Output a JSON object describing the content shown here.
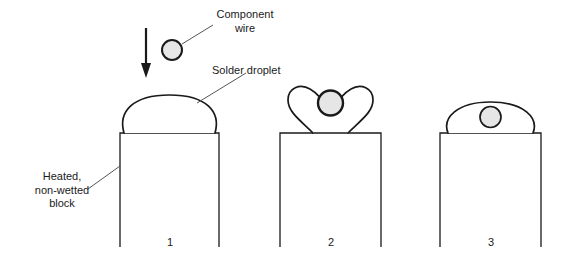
{
  "figure": {
    "title_present": false,
    "background_color": "#ffffff",
    "stroke_color": "#1a1a1a",
    "wire_fill_color": "#e6e6e6",
    "droplet_fill_color": "#ffffff"
  },
  "annotations": {
    "component_wire": {
      "lines": [
        "Component",
        "wire"
      ],
      "text": "Component wire"
    },
    "solder_droplet": {
      "lines": [
        "Solder droplet"
      ],
      "text": "Solder droplet"
    },
    "heated_block": {
      "lines": [
        "Heated,",
        "non-wetted",
        "block"
      ],
      "text": "Heated, non-wetted block"
    }
  },
  "panels": [
    {
      "number": "1",
      "description": "Solder droplet domed on heated non-wetted block, component wire descending from above"
    },
    {
      "number": "2",
      "description": "Solder droplet split into two lobes around the component wire"
    },
    {
      "number": "3",
      "description": "Component wire enclosed within the flattened solder droplet"
    }
  ],
  "arrow": {
    "name": "downward-motion-arrow",
    "direction": "down"
  }
}
